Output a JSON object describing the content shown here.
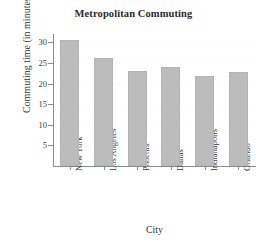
{
  "chart_data": {
    "type": "bar",
    "title": "Metropolitan Commuting",
    "xlabel": "City",
    "ylabel": "Commuting time (in minutes)",
    "categories": [
      "New York",
      "Los Angeles",
      "Phoenix",
      "Dallas",
      "Indianapolis",
      "Orlando"
    ],
    "values": [
      30.5,
      26.3,
      23.0,
      24.0,
      21.8,
      22.8
    ],
    "yticks": [
      5,
      10,
      15,
      20,
      25,
      30
    ],
    "ylim": [
      0,
      32
    ],
    "grid": false,
    "legend": null,
    "bar_color": "#bcbcbc",
    "axis_color": "#8c8c8c",
    "text_color": "#3a3a3a",
    "background": "#ffffff"
  }
}
